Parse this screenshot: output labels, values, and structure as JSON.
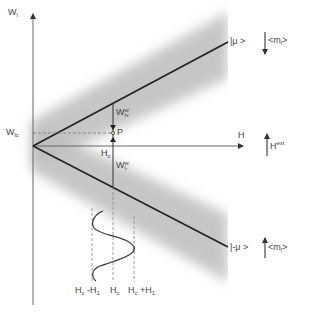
{
  "axes": {
    "y_axis": {
      "label": "W",
      "label_sub": "l"
    },
    "x_axis": {
      "label": "H"
    }
  },
  "points": {
    "w_lc": {
      "label": "W",
      "label_sub": "lc"
    },
    "h_c": {
      "label": "H",
      "label_sub": "c"
    },
    "p": {
      "label": "P"
    }
  },
  "gaps": {
    "w_plus": {
      "label": "W",
      "sup": "w",
      "sub": "l+"
    },
    "w_minus": {
      "label": "W",
      "sup": "w",
      "sub": "l-"
    }
  },
  "states": {
    "upper": {
      "ket": "|μ >",
      "moment": "<m",
      "moment_sub": "l",
      "moment_end": ">",
      "arrow": "down"
    },
    "lower": {
      "ket": "|-μ >",
      "moment": "<m",
      "moment_sub": "l",
      "moment_end": ">",
      "arrow": "up"
    }
  },
  "field": {
    "label": "H",
    "sup": "ext",
    "arrow": "up"
  },
  "oscillation": {
    "ticks": [
      {
        "label": "H",
        "sub": "c",
        "suffix": " -H",
        "suffix_sub": "1"
      },
      {
        "label": "H",
        "sub": "c",
        "suffix": "",
        "suffix_sub": ""
      },
      {
        "label": "H",
        "sub": "c",
        "suffix": " +H",
        "suffix_sub": "1"
      }
    ]
  },
  "colors": {
    "line": "#222222",
    "axis": "#555555",
    "band": "#b8b8b8",
    "dashed": "#777777"
  }
}
